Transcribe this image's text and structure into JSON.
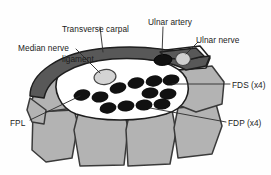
{
  "figure": {
    "type": "anatomical-cross-section",
    "palette": {
      "background": "#fefefe",
      "bone_fill": "#b3b3b3",
      "bone_stroke": "#3a3a3a",
      "ligament_fill": "#585858",
      "ligament_stroke": "#1e1e1e",
      "tunnel_fill": "#ffffff",
      "tunnel_stroke": "#1e1e1e",
      "tendon_fill": "#111111",
      "nerve_fill": "#cfcfcf",
      "nerve_stroke": "#444444",
      "leader_line": "#2a2a2a",
      "text": "#1b1b1b"
    }
  },
  "labels": [
    {
      "id": "transverse-carpal-ligament",
      "text": "Transverse carpal\nligament",
      "line1": "Transverse carpal",
      "line2": "ligament",
      "x": 62,
      "y": 4,
      "align": "left"
    },
    {
      "id": "ulnar-artery",
      "text": "Ulnar artery",
      "x": 148,
      "y": 17,
      "align": "left"
    },
    {
      "id": "ulnar-nerve",
      "text": "Ulnar nerve",
      "x": 196,
      "y": 35,
      "align": "left"
    },
    {
      "id": "median-nerve",
      "text": "Median nerve",
      "x": 18,
      "y": 43,
      "align": "left"
    },
    {
      "id": "fds",
      "text": "FDS (x4)",
      "x": 232,
      "y": 80,
      "align": "left",
      "clipped": true
    },
    {
      "id": "fdp",
      "text": "FDP (x4)",
      "x": 228,
      "y": 118,
      "align": "left"
    },
    {
      "id": "fpl",
      "text": "FPL",
      "x": 10,
      "y": 118,
      "align": "left"
    }
  ],
  "structures": {
    "ligament": {
      "name": "Transverse carpal ligament",
      "fill": "#585858"
    },
    "tunnel_space": {
      "name": "Carpal tunnel",
      "fill": "#ffffff"
    },
    "median_nerve": {
      "name": "Median nerve",
      "fill": "#d4d4d4",
      "cx": 105,
      "cy": 77,
      "rx": 11,
      "ry": 7.5,
      "rot": -8
    },
    "ulnar_artery": {
      "name": "Ulnar artery",
      "fill": "#111111",
      "cx": 163,
      "cy": 60,
      "rx": 9,
      "ry": 5.5,
      "rot": -6
    },
    "ulnar_nerve": {
      "name": "Ulnar nerve",
      "fill": "#cfcfcf",
      "cx": 183,
      "cy": 59,
      "rx": 7.5,
      "ry": 6.5,
      "rot": 0
    },
    "fpl_tendon": {
      "name": "Flexor pollicis longus tendon",
      "fill": "#111111",
      "cx": 82,
      "cy": 95,
      "rx": 8.5,
      "ry": 5.5,
      "rot": -12
    }
  },
  "tendons": {
    "fds_label": "FDS (x4)",
    "fdp_label": "FDP (x4)",
    "fds_row": [
      {
        "cx": 118,
        "cy": 88,
        "rx": 8.5,
        "ry": 5.5,
        "rot": -14
      },
      {
        "cx": 136,
        "cy": 83,
        "rx": 8.5,
        "ry": 5.5,
        "rot": -12
      },
      {
        "cx": 154,
        "cy": 81,
        "rx": 8.5,
        "ry": 5.5,
        "rot": -10
      },
      {
        "cx": 171,
        "cy": 80,
        "rx": 8.5,
        "ry": 5.5,
        "rot": -8
      }
    ],
    "mid_row": [
      {
        "cx": 82,
        "cy": 95,
        "rx": 8.5,
        "ry": 5.5,
        "rot": -12
      },
      {
        "cx": 100,
        "cy": 97,
        "rx": 8.5,
        "ry": 5.5,
        "rot": -8
      },
      {
        "cx": 150,
        "cy": 93,
        "rx": 8.5,
        "ry": 5.5,
        "rot": -6
      },
      {
        "cx": 168,
        "cy": 94,
        "rx": 8.5,
        "ry": 5.5,
        "rot": -6
      }
    ],
    "fdp_row": [
      {
        "cx": 108,
        "cy": 108,
        "rx": 8.5,
        "ry": 5.5,
        "rot": -10
      },
      {
        "cx": 126,
        "cy": 106,
        "rx": 8.5,
        "ry": 5.5,
        "rot": -6
      },
      {
        "cx": 144,
        "cy": 105,
        "rx": 8.5,
        "ry": 5.5,
        "rot": -4
      },
      {
        "cx": 162,
        "cy": 104,
        "rx": 8.5,
        "ry": 5.5,
        "rot": -4
      }
    ]
  },
  "carpal_bones": {
    "count": 4,
    "name": "Carpal bones",
    "fill": "#b3b3b3"
  }
}
